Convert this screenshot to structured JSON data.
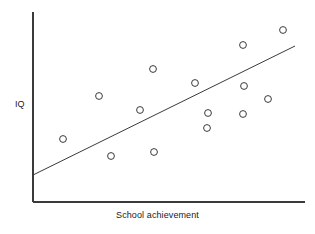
{
  "figure": {
    "type": "scatter-with-trendline",
    "background_color": "#ffffff",
    "ink_color": "#3a3a3a"
  },
  "labels": {
    "ylabel": "IQ",
    "xlabel": "School achievement"
  },
  "chart_data": {
    "type": "scatter",
    "title": "",
    "xlabel": "School achievement",
    "ylabel": "IQ",
    "xlim": [
      0,
      100
    ],
    "ylim": [
      0,
      100
    ],
    "grid": false,
    "legend": null,
    "axes": {
      "x_axis_pixels": {
        "x1": 33,
        "y1": 202,
        "x2": 305,
        "y2": 202
      },
      "y_axis_pixels": {
        "x1": 33,
        "y1": 12,
        "x2": 33,
        "y2": 202
      },
      "ticks_visible": false,
      "tick_labels": []
    },
    "marker": {
      "shape": "circle",
      "filled": false,
      "radius_px": 3.4,
      "stroke": "#3a3a3a",
      "stroke_width": 1
    },
    "points_pixels": [
      {
        "x": 63,
        "y": 139
      },
      {
        "x": 99,
        "y": 96
      },
      {
        "x": 111,
        "y": 156
      },
      {
        "x": 140,
        "y": 110
      },
      {
        "x": 153,
        "y": 69
      },
      {
        "x": 154,
        "y": 152
      },
      {
        "x": 195,
        "y": 83
      },
      {
        "x": 208,
        "y": 113
      },
      {
        "x": 207,
        "y": 128
      },
      {
        "x": 243,
        "y": 114
      },
      {
        "x": 244,
        "y": 86
      },
      {
        "x": 243,
        "y": 45
      },
      {
        "x": 268,
        "y": 99
      },
      {
        "x": 283,
        "y": 30
      }
    ],
    "x": [
      11,
      24,
      29,
      39,
      44,
      44,
      60,
      64,
      64,
      77,
      78,
      77,
      86,
      92
    ],
    "y": [
      33,
      56,
      24,
      48,
      70,
      26,
      63,
      47,
      39,
      46,
      61,
      83,
      54,
      91
    ],
    "trendline": {
      "visible": true,
      "style": "solid",
      "stroke": "#3a3a3a",
      "stroke_width": 1,
      "pixels": {
        "x1": 33,
        "y1": 175,
        "x2": 295,
        "y2": 46
      },
      "endpoints_data": [
        {
          "x": 0,
          "y": 14
        },
        {
          "x": 96,
          "y": 82
        }
      ]
    }
  }
}
